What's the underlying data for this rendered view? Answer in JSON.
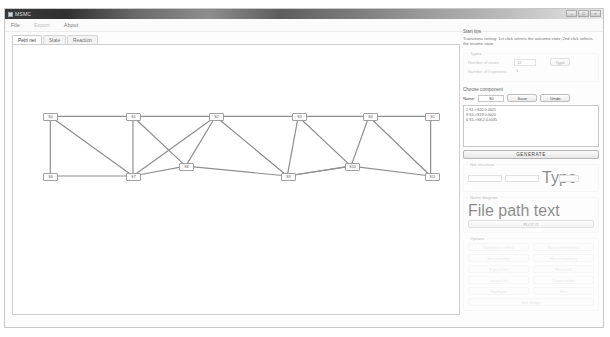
{
  "window": {
    "title": "MSMC",
    "controls": [
      "–",
      "□",
      "×"
    ]
  },
  "menu": {
    "items": [
      {
        "label": "File",
        "enabled": true
      },
      {
        "label": "Export",
        "enabled": false
      },
      {
        "label": "About",
        "enabled": true
      }
    ]
  },
  "tabs": [
    {
      "label": "Petri net",
      "active": true
    },
    {
      "label": "State",
      "active": false
    },
    {
      "label": "Reaction",
      "active": false
    }
  ],
  "side": {
    "start_tips_title": "Start tips",
    "start_tips_text": "Transitions setting: 1st click selects the outcome state, 2nd click selects the income state",
    "type": {
      "legend": "Types",
      "states_label": "Number of states",
      "states_value": "12",
      "fragments_label": "Number of fragments",
      "fragments_value": "1",
      "apply_label": "Type"
    },
    "component": {
      "legend": "Choose component",
      "name_label": "Name:",
      "name_value": "S0",
      "save_label": "Save",
      "undo_label": "Undo",
      "list": [
        "2  S1->S20  0.0025",
        "9  S1->S19  0.0020",
        "6  S1->S8-2  0.0035"
      ]
    },
    "generate_label": "GENERATE",
    "structure": {
      "legend": "Net structure",
      "f1": "",
      "f2": "",
      "tag_label": "Type",
      "f3": ""
    },
    "diagram": {
      "legend": "Name diagram",
      "field_label": "File path text",
      "button_label": "PLOT IT"
    },
    "options": {
      "legend": "Options",
      "buttons": [
        "Transition colors",
        "Reset transitions",
        "Set marking",
        "Reset marking",
        "Export file",
        "Reset fill",
        "Import file",
        "Create folder",
        "Highlight",
        "Blur",
        "Set image"
      ]
    }
  },
  "graph": {
    "nodes": [
      {
        "id": "S0",
        "label": "S0",
        "x": 30,
        "y": 68
      },
      {
        "id": "S1",
        "label": "S1",
        "x": 113,
        "y": 68
      },
      {
        "id": "S2",
        "label": "S2",
        "x": 196,
        "y": 68
      },
      {
        "id": "S3",
        "label": "S3",
        "x": 279,
        "y": 68
      },
      {
        "id": "S4",
        "label": "S4",
        "x": 350,
        "y": 68
      },
      {
        "id": "S5",
        "label": "S5",
        "x": 412,
        "y": 68
      },
      {
        "id": "S6",
        "label": "S6",
        "x": 30,
        "y": 128
      },
      {
        "id": "S7",
        "label": "S7",
        "x": 113,
        "y": 128
      },
      {
        "id": "S8",
        "label": "S8",
        "x": 166,
        "y": 118
      },
      {
        "id": "S9",
        "label": "S9",
        "x": 268,
        "y": 128
      },
      {
        "id": "S10",
        "label": "S10",
        "x": 332,
        "y": 118
      },
      {
        "id": "S11",
        "label": "S11",
        "x": 412,
        "y": 128
      }
    ],
    "edges": [
      [
        "S0",
        "S1"
      ],
      [
        "S1",
        "S2"
      ],
      [
        "S2",
        "S3"
      ],
      [
        "S3",
        "S4"
      ],
      [
        "S4",
        "S5"
      ],
      [
        "S0",
        "S6"
      ],
      [
        "S0",
        "S7"
      ],
      [
        "S1",
        "S7"
      ],
      [
        "S1",
        "S8"
      ],
      [
        "S2",
        "S7"
      ],
      [
        "S2",
        "S9"
      ],
      [
        "S3",
        "S9"
      ],
      [
        "S3",
        "S10"
      ],
      [
        "S4",
        "S10"
      ],
      [
        "S4",
        "S11"
      ],
      [
        "S5",
        "S11"
      ],
      [
        "S6",
        "S7"
      ],
      [
        "S7",
        "S8"
      ],
      [
        "S8",
        "S9"
      ],
      [
        "S9",
        "S10"
      ],
      [
        "S10",
        "S11"
      ],
      [
        "S2",
        "S8"
      ],
      [
        "S10",
        "S9"
      ]
    ]
  }
}
